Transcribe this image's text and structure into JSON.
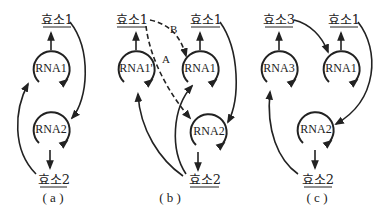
{
  "figure": {
    "colors": {
      "ink": "#222222",
      "background": "#ffffff"
    }
  },
  "panels": [
    {
      "caption": "( a )",
      "nodes": {
        "enzyme_top": "효소1",
        "rna_top": "RNA1",
        "rna_bottom": "RNA2",
        "enzyme_bottom": "효소2"
      }
    },
    {
      "caption": "( b )",
      "nodes": {
        "enzyme_top_left": "효소1",
        "enzyme_top_right": "효소1",
        "rna_top_left": "RNA1'",
        "rna_top_right": "RNA1",
        "rna_bottom": "RNA2",
        "enzyme_bottom": "효소2"
      },
      "path_labels": {
        "a": "A",
        "b": "B"
      }
    },
    {
      "caption": "( c )",
      "nodes": {
        "enzyme_top_left": "효소3",
        "enzyme_top_right": "효소1",
        "rna_top_left": "RNA3",
        "rna_top_right": "RNA1",
        "rna_bottom": "RNA2",
        "enzyme_bottom": "효소2"
      }
    }
  ]
}
